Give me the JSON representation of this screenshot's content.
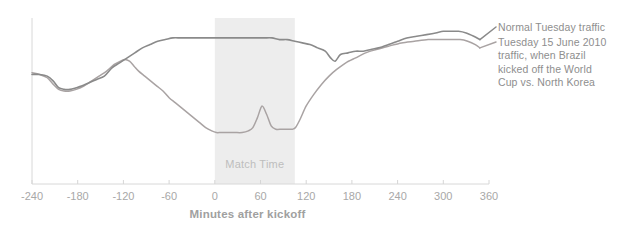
{
  "chart_data": {
    "type": "line",
    "title": "",
    "xlabel": "Minutes after kickoff",
    "ylabel": "",
    "xlim": [
      -240,
      360
    ],
    "ylim": [
      0,
      100
    ],
    "grid": false,
    "legend_position": "right",
    "x_ticks": [
      -240,
      -180,
      -120,
      -60,
      0,
      60,
      120,
      180,
      240,
      300,
      360
    ],
    "x_tick_labels": [
      "-240",
      "-180",
      "-120",
      "-60",
      "0",
      "60",
      "120",
      "180",
      "240",
      "300",
      "360"
    ],
    "y_axis_visible": true,
    "y_ticks_visible": false,
    "annotations": [
      {
        "name": "match-time-band",
        "label": "Match Time",
        "type": "vertical-band",
        "x_start": 0,
        "x_end": 105,
        "color": "#ededed"
      }
    ],
    "series": [
      {
        "name": "Normal Tuesday traffic",
        "color": "#8a8a8a",
        "legend_label": "Normal Tuesday traffic",
        "x": [
          -240,
          -230,
          -220,
          -212,
          -205,
          -198,
          -190,
          -182,
          -175,
          -165,
          -155,
          -145,
          -135,
          -125,
          -115,
          -105,
          -95,
          -85,
          -75,
          -65,
          -55,
          -45,
          -35,
          -25,
          -15,
          -5,
          5,
          15,
          25,
          35,
          45,
          55,
          65,
          75,
          85,
          95,
          105,
          115,
          125,
          135,
          145,
          152,
          158,
          165,
          175,
          185,
          195,
          205,
          215,
          228,
          240,
          252,
          265,
          278,
          290,
          300,
          310,
          320,
          330,
          340,
          348
        ],
        "y": [
          66,
          66,
          65,
          62,
          58,
          57,
          57,
          58,
          59,
          61,
          63,
          65,
          70,
          73,
          76,
          79,
          82,
          84,
          86,
          87,
          88,
          88,
          88,
          88,
          88,
          88,
          88,
          88,
          88,
          88,
          88,
          88,
          88,
          88,
          87,
          87,
          86,
          85,
          84,
          82,
          80,
          76,
          74,
          78,
          79,
          80,
          80,
          81,
          82,
          84,
          86,
          88,
          89,
          90,
          91,
          92,
          92,
          92,
          91,
          89,
          87
        ]
      },
      {
        "name": "Tuesday 15 June 2010 traffic, when Brazil kicked off the World Cup vs. North Korea",
        "color": "#a9a3a3",
        "legend_label": "Tuesday 15 June 2010 traffic, when Brazil kicked off the World Cup vs. North Korea",
        "x": [
          -240,
          -230,
          -220,
          -212,
          -205,
          -198,
          -190,
          -182,
          -172,
          -162,
          -152,
          -142,
          -132,
          -124,
          -118,
          -112,
          -106,
          -100,
          -92,
          -84,
          -76,
          -68,
          -60,
          -52,
          -44,
          -36,
          -28,
          -20,
          -12,
          -4,
          2,
          8,
          16,
          26,
          36,
          44,
          50,
          56,
          62,
          68,
          74,
          80,
          88,
          96,
          102,
          106,
          112,
          120,
          130,
          140,
          150,
          160,
          172,
          185,
          198,
          212,
          228,
          245,
          262,
          280,
          295,
          310,
          322,
          332,
          342,
          348
        ],
        "y": [
          67,
          66,
          64,
          60,
          57,
          56,
          56,
          57,
          59,
          62,
          65,
          68,
          72,
          74,
          75,
          74,
          71,
          68,
          65,
          62,
          59,
          56,
          52,
          49,
          46,
          43,
          40,
          37,
          34,
          32,
          31,
          31,
          31,
          31,
          31,
          32,
          34,
          40,
          47,
          42,
          35,
          33,
          33,
          33,
          33,
          34,
          39,
          47,
          54,
          60,
          65,
          69,
          73,
          76,
          79,
          81,
          83,
          85,
          86,
          87,
          87,
          87,
          87,
          86,
          84,
          82
        ]
      }
    ]
  },
  "legend": {
    "normal_label": "Normal Tuesday traffic",
    "match_label": "Tuesday 15 June 2010 traffic, when Brazil kicked off the World Cup vs. North Korea"
  },
  "axis": {
    "x_title": "Minutes after kickoff"
  },
  "band": {
    "label": "Match Time"
  },
  "colors": {
    "normal_line": "#8a8a8a",
    "match_line": "#a9a3a3",
    "band_fill": "#ededed",
    "axis": "#d6d6d6",
    "tick_text": "#a8a8a8",
    "legend_text": "#8e8e8e",
    "band_text": "#bdbdbd",
    "axis_title_text": "#a0a0a0"
  },
  "ticks": [
    {
      "label": "-240",
      "x": 32
    },
    {
      "label": "-180",
      "x": 77
    },
    {
      "label": "-120",
      "x": 123
    },
    {
      "label": "-60",
      "x": 169
    },
    {
      "label": "0",
      "x": 215
    },
    {
      "label": "60",
      "x": 260
    },
    {
      "label": "120",
      "x": 306
    },
    {
      "label": "180",
      "x": 352
    },
    {
      "label": "240",
      "x": 397
    },
    {
      "label": "300",
      "x": 443
    },
    {
      "label": "360",
      "x": 489
    }
  ]
}
